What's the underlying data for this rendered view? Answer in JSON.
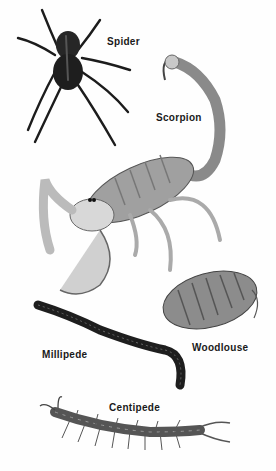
{
  "figure": {
    "background": "#fefefe",
    "labels": {
      "spider": "Spider",
      "scorpion": "Scorpion",
      "woodlouse": "Woodlouse",
      "millipede": "Millipede",
      "centipede": "Centipede"
    }
  }
}
